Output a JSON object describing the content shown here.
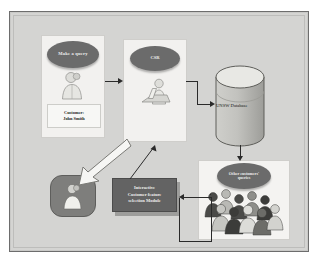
{
  "diagram": {
    "background_color": "#d4d4d2",
    "frame_color": "#6d6d6d",
    "accent_dark": "#6b6b6b",
    "module_color": "#636363",
    "connector_color": "#2a2a2a"
  },
  "nodes": {
    "customer": {
      "bubble": "Make a query",
      "label_line1": "Customer:",
      "label_line2": "John Smith",
      "figure_icon": "customer-person-icon"
    },
    "csr": {
      "bubble": "CSR",
      "figure_icon": "agent-at-desk-icon"
    },
    "database": {
      "label": "UNSW Database",
      "shape_icon": "database-cylinder-icon"
    },
    "crowd": {
      "bubble_line1": "Other customers'",
      "bubble_line2": "queries",
      "figures_icon": "crowd-of-people-icon"
    },
    "module": {
      "line1": "Interactive",
      "line2": "Customer feature",
      "line3": "selection Module"
    },
    "agent_box": {
      "figure_icon": "representative-person-icon"
    }
  },
  "connectors": [
    {
      "name": "customer-to-csr",
      "from": "customer",
      "to": "csr",
      "style": "solid-arrow"
    },
    {
      "name": "csr-to-database",
      "from": "csr",
      "to": "database",
      "style": "elbow-arrow"
    },
    {
      "name": "database-to-crowd",
      "from": "database",
      "to": "crowd",
      "style": "vertical-arrow"
    },
    {
      "name": "crowd-to-module",
      "from": "crowd",
      "to": "module",
      "style": "elbow-arrow"
    },
    {
      "name": "module-to-csr",
      "from": "module",
      "to": "csr",
      "style": "thin-diagonal-arrow"
    },
    {
      "name": "csr-to-agent",
      "from": "csr",
      "to": "agent_box",
      "style": "hollow-block-arrow"
    },
    {
      "name": "crowd-feedback-loop",
      "from": "crowd",
      "to": "agent_box",
      "style": "elbow-loop"
    }
  ]
}
